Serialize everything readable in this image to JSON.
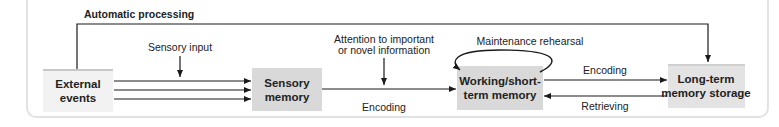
{
  "diagram": {
    "nodes": {
      "external_events": {
        "line1": "External",
        "line2": "events"
      },
      "sensory_memory": {
        "line1": "Sensory",
        "line2": "memory"
      },
      "working_memory": {
        "line1": "Working/short-",
        "line2": "term memory"
      },
      "long_term_memory": {
        "line1": "Long-term",
        "line2": "memory storage"
      }
    },
    "edges": {
      "automatic_processing": "Automatic processing",
      "sensory_input": "Sensory input",
      "attention_line1": "Attention to important",
      "attention_line2": "or novel information",
      "encoding_sensory_to_working": "Encoding",
      "maintenance_rehearsal": "Maintenance rehearsal",
      "encoding_working_to_longterm": "Encoding",
      "retrieving": "Retrieving"
    },
    "colors": {
      "external_box": "#f2f2f2",
      "external_box_top": "#c8c8c8",
      "memory_box": "#d9d9d9",
      "line": "#1a1a1a",
      "panel_border": "#e2e2e2"
    }
  }
}
